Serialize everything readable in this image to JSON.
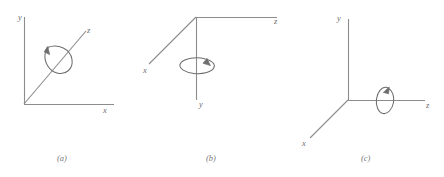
{
  "figure": {
    "background_color": "#ffffff",
    "stroke_color": "#8c8c8c",
    "label_color": "#6f6f6f",
    "caption_color": "#7a7a7a",
    "panels": [
      {
        "id": "a",
        "caption": "(a)",
        "caption_x": 57,
        "caption_y": 154,
        "description": "coordinate axes with rotation about the z axis",
        "rotation_axis": "z",
        "axes": [
          {
            "name": "y",
            "label": "y",
            "label_x": 18,
            "label_y": 13,
            "direction": "up"
          },
          {
            "name": "x",
            "label": "x",
            "label_x": 103,
            "label_y": 106,
            "direction": "right"
          },
          {
            "name": "z",
            "label": "z",
            "label_x": 87,
            "label_y": 26,
            "direction": "up-right-diagonal"
          }
        ]
      },
      {
        "id": "b",
        "caption": "(b)",
        "caption_x": 206,
        "caption_y": 154,
        "description": "coordinate axes with rotation about the y axis",
        "rotation_axis": "y",
        "axes": [
          {
            "name": "x",
            "label": "x",
            "label_x": 143,
            "label_y": 66,
            "direction": "down-left-diagonal"
          },
          {
            "name": "z",
            "label": "z",
            "label_x": 274,
            "label_y": 17,
            "direction": "right"
          },
          {
            "name": "y",
            "label": "y",
            "label_x": 199,
            "label_y": 100,
            "direction": "down"
          }
        ]
      },
      {
        "id": "c",
        "caption": "(c)",
        "caption_x": 361,
        "caption_y": 154,
        "description": "coordinate axes with rotation about the z axis",
        "rotation_axis": "z",
        "axes": [
          {
            "name": "y",
            "label": "y",
            "label_x": 337,
            "label_y": 14,
            "direction": "up"
          },
          {
            "name": "z",
            "label": "z",
            "label_x": 426,
            "label_y": 101,
            "direction": "right"
          },
          {
            "name": "x",
            "label": "x",
            "label_x": 302,
            "label_y": 139,
            "direction": "down-left-diagonal"
          }
        ]
      }
    ]
  }
}
